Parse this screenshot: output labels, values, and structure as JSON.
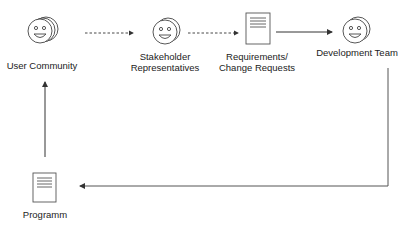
{
  "nodes": {
    "user_community": {
      "label": "User Community",
      "icon": "smiley-group-icon"
    },
    "stakeholders": {
      "label_line1": "Stakeholder",
      "label_line2": "Representatives",
      "icon": "smiley-pair-icon"
    },
    "requirements": {
      "label_line1": "Requirements/",
      "label_line2": "Change Requests",
      "icon": "document-icon"
    },
    "dev_team": {
      "label": "Development Team",
      "icon": "smiley-pair-icon"
    },
    "programm": {
      "label": "Programm",
      "icon": "document-icon"
    }
  },
  "edges": [
    {
      "from": "user_community",
      "to": "stakeholders",
      "style": "dashed"
    },
    {
      "from": "stakeholders",
      "to": "requirements",
      "style": "dashed"
    },
    {
      "from": "requirements",
      "to": "dev_team",
      "style": "solid"
    },
    {
      "from": "dev_team",
      "to": "programm",
      "style": "solid"
    },
    {
      "from": "programm",
      "to": "user_community",
      "style": "solid"
    }
  ],
  "colors": {
    "stroke": "#444444",
    "text": "#222222",
    "background": "#ffffff"
  }
}
